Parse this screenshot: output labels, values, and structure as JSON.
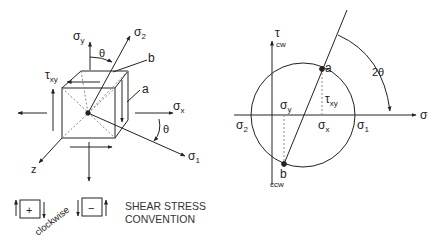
{
  "figure": {
    "colors": {
      "line": "#222222",
      "dashed": "#888888",
      "background": "#ffffff"
    }
  },
  "element": {
    "labels": {
      "sigma_y": "σ",
      "sigma_y_sub": "y",
      "sigma_x": "σ",
      "sigma_x_sub": "x",
      "sigma_1": "σ",
      "sigma_1_sub": "1",
      "sigma_2": "σ",
      "sigma_2_sub": "2",
      "tau_xy": "τ",
      "tau_xy_sub": "xy",
      "theta_top": "θ",
      "theta_right": "θ",
      "point_a": "a",
      "point_b": "b",
      "z_axis": "z"
    }
  },
  "convention": {
    "positive_sign": "+",
    "negative_sign": "−",
    "clockwise_label": "clockwise",
    "caption_line1": "SHEAR STRESS",
    "caption_line2": "CONVENTION"
  },
  "mohr": {
    "labels": {
      "tau": "τ",
      "tau_sub_cw": "cw",
      "ccw": "ccw",
      "sigma_axis": "σ",
      "sigma_1": "σ",
      "sigma_1_sub": "1",
      "sigma_2": "σ",
      "sigma_2_sub": "2",
      "sigma_x": "σ",
      "sigma_x_sub": "x",
      "sigma_y": "σ",
      "sigma_y_sub": "y",
      "tau_xy": "τ",
      "tau_xy_sub": "xy",
      "point_a": "a",
      "point_b": "b",
      "two_theta": "2θ"
    }
  }
}
